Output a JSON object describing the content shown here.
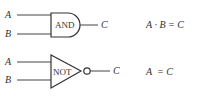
{
  "gates": [
    {
      "type": "AND",
      "label": "AND",
      "inputs": [
        "A",
        "B"
      ],
      "output": "C",
      "expression": "A · B = C"
    },
    {
      "type": "NOT",
      "label": "NOT",
      "inputs": [
        "A",
        "B"
      ],
      "output": "C",
      "expression": "A  = C"
    }
  ],
  "colors": {
    "stroke": "#333333",
    "background": "#ffffff"
  }
}
